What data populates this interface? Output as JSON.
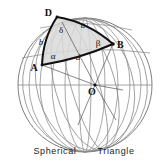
{
  "figure": {
    "caption": "Spherical   Triangle",
    "title": "Spherical Triangle",
    "colors": {
      "grid": "#8a8a8a",
      "outline": "#6f6f6f",
      "triangle_edge": "#111111",
      "triangle_fill": "#d9d9d9",
      "radius_line": "#555555",
      "background": "#ffffff",
      "text": "#111111"
    },
    "sphere": {
      "center_x": 85,
      "center_y": 85,
      "radius_x": 67,
      "radius_y": 67,
      "meridian_count": 9,
      "equator_shown": true
    },
    "vertices": [
      {
        "name": "D",
        "label": "D",
        "x": 57,
        "y": 17
      },
      {
        "name": "A",
        "label": "A",
        "x": 42,
        "y": 65
      },
      {
        "name": "B",
        "label": "B",
        "x": 113,
        "y": 44
      },
      {
        "name": "O",
        "label": "O",
        "x": 95,
        "y": 85
      }
    ],
    "vertex_labels": {
      "D": "D",
      "A": "A",
      "B": "B",
      "O": "O"
    },
    "side_labels": {
      "a": "a",
      "b": "b",
      "d": "d"
    },
    "angle_labels": {
      "delta": "δ",
      "alpha": "α",
      "beta": "β"
    },
    "label_positions": {
      "D": {
        "x": 52,
        "y": 16
      },
      "A": {
        "x": 34,
        "y": 71
      },
      "B": {
        "x": 115,
        "y": 48
      },
      "O": {
        "x": 92,
        "y": 94
      },
      "a": {
        "x": 83,
        "y": 28
      },
      "b": {
        "x": 41,
        "y": 44
      },
      "d": {
        "x": 78,
        "y": 59
      },
      "delta": {
        "x": 61,
        "y": 32
      },
      "alpha": {
        "x": 53,
        "y": 58
      },
      "beta": {
        "x": 98,
        "y": 45
      }
    }
  }
}
